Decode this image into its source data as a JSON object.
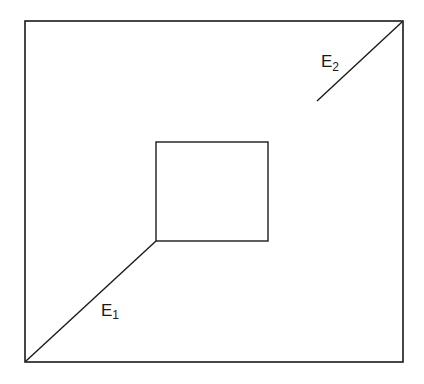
{
  "diagram": {
    "stroke_color": "#1a1a1a",
    "background": "#ffffff",
    "outer_rect": {
      "x1": 25,
      "y1": 21,
      "x2": 403,
      "y2": 362
    },
    "inner_rect": {
      "x1": 156,
      "y1": 142,
      "x2": 268,
      "y2": 241
    },
    "edges": [
      {
        "name": "E",
        "subscript": "1",
        "line": {
          "x1": 26,
          "y1": 361,
          "x2": 156,
          "y2": 241
        }
      },
      {
        "name": "E",
        "subscript": "2",
        "line": {
          "x1": 317,
          "y1": 101,
          "x2": 402,
          "y2": 22
        }
      }
    ]
  }
}
